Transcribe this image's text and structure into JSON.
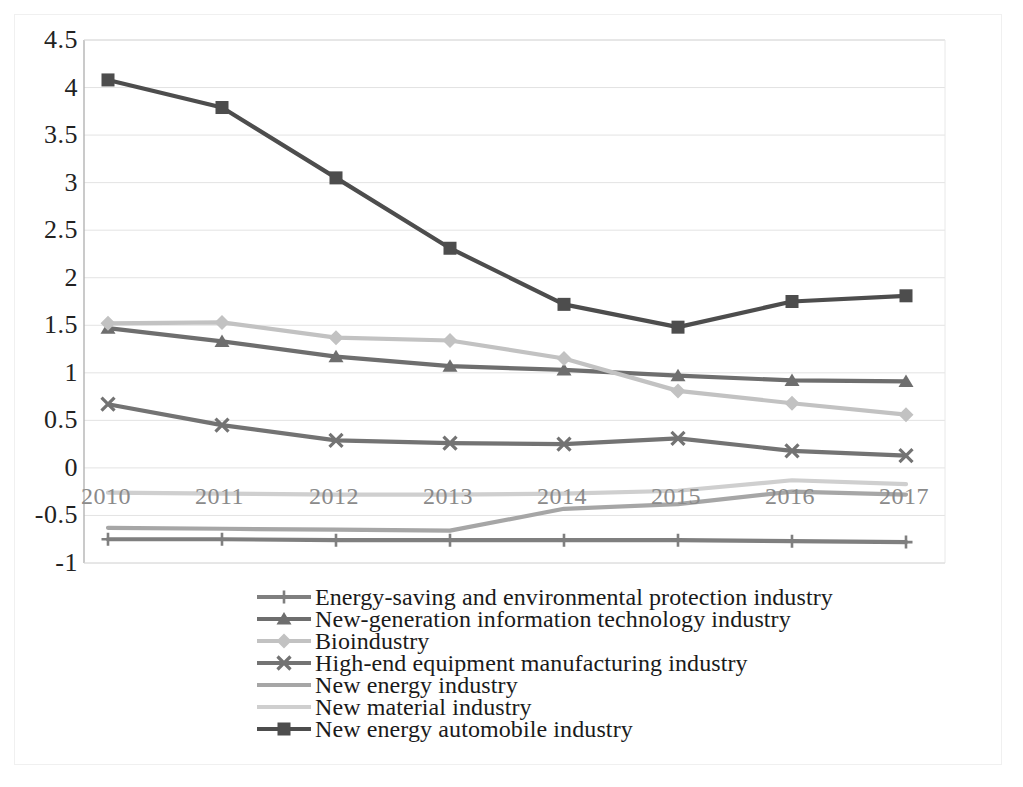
{
  "chart_data": {
    "type": "line",
    "title": "",
    "subtitle": "",
    "xlabel": "",
    "ylabel": "",
    "x": [
      "2010",
      "2011",
      "2012",
      "2013",
      "2014",
      "2015",
      "2016",
      "2017"
    ],
    "categories": [
      "2010",
      "2011",
      "2012",
      "2013",
      "2014",
      "2015",
      "2016",
      "2017"
    ],
    "ylim": [
      -1,
      4.5
    ],
    "yticks": [
      "4.5",
      "4",
      "3.5",
      "3",
      "2.5",
      "2",
      "1.5",
      "1",
      "0.5",
      "0",
      "-0.5",
      "-1"
    ],
    "ytick_values": [
      4.5,
      4,
      3.5,
      3,
      2.5,
      2,
      1.5,
      1,
      0.5,
      0,
      -0.5,
      -1
    ],
    "grid": true,
    "legend_position": "bottom",
    "series": [
      {
        "name": "Energy-saving and environmental protection industry",
        "marker": "plus",
        "color": "#7f7f7f",
        "values": [
          -0.75,
          -0.75,
          -0.76,
          -0.76,
          -0.76,
          -0.76,
          -0.77,
          -0.78
        ]
      },
      {
        "name": "New-generation information technology industry",
        "marker": "triangle",
        "color": "#6e6e6e",
        "values": [
          1.47,
          1.33,
          1.17,
          1.07,
          1.03,
          0.97,
          0.92,
          0.91
        ]
      },
      {
        "name": "Bioindustry",
        "marker": "diamond",
        "color": "#c2c2c2",
        "values": [
          1.52,
          1.53,
          1.37,
          1.34,
          1.15,
          0.81,
          0.68,
          0.56
        ]
      },
      {
        "name": "High-end equipment manufacturing industry",
        "marker": "x",
        "color": "#737373",
        "values": [
          0.67,
          0.45,
          0.29,
          0.26,
          0.25,
          0.31,
          0.18,
          0.13
        ]
      },
      {
        "name": "New energy industry",
        "marker": "none",
        "color": "#a6a6a6",
        "values": [
          -0.63,
          -0.64,
          -0.65,
          -0.66,
          -0.43,
          -0.38,
          -0.25,
          -0.28
        ]
      },
      {
        "name": "New material industry",
        "marker": "none",
        "color": "#cfcfcf",
        "values": [
          -0.26,
          -0.27,
          -0.28,
          -0.28,
          -0.27,
          -0.24,
          -0.13,
          -0.17
        ]
      },
      {
        "name": "New energy automobile industry",
        "marker": "square",
        "color": "#4d4d4d",
        "values": [
          4.08,
          3.79,
          3.05,
          2.31,
          1.72,
          1.48,
          1.75,
          1.81
        ]
      }
    ]
  },
  "axes": {
    "y_tick_labels": [
      "4.5",
      "4",
      "3.5",
      "3",
      "2.5",
      "2",
      "1.5",
      "1",
      "0.5",
      "0",
      "-0.5",
      "-1"
    ],
    "x_tick_labels": [
      "2010",
      "2011",
      "2012",
      "2013",
      "2014",
      "2015",
      "2016",
      "2017"
    ]
  },
  "legend": {
    "items": [
      {
        "label": "Energy-saving and environmental protection industry",
        "color": "#7f7f7f",
        "marker": "plus-marker"
      },
      {
        "label": "New-generation information technology industry",
        "color": "#6e6e6e",
        "marker": "triangle-marker"
      },
      {
        "label": "Bioindustry",
        "color": "#c2c2c2",
        "marker": "diamond-marker"
      },
      {
        "label": "High-end equipment manufacturing industry",
        "color": "#737373",
        "marker": "x-marker"
      },
      {
        "label": "New energy industry",
        "color": "#a6a6a6",
        "marker": "line-marker"
      },
      {
        "label": "New material industry",
        "color": "#cfcfcf",
        "marker": "line-marker"
      },
      {
        "label": "New energy automobile industry",
        "color": "#4d4d4d",
        "marker": "square-marker"
      }
    ]
  }
}
